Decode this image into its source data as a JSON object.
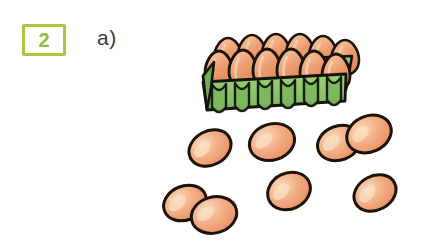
{
  "page": {
    "type": "math-worksheet-exercise",
    "background_color": "#ffffff",
    "width": 435,
    "height": 252
  },
  "exercise": {
    "number": "2",
    "badge_border_color": "#a9ca3c",
    "badge_text_color": "#93bd3e",
    "part_label": "a)",
    "part_label_color": "#3a3a3a"
  },
  "illustration": {
    "name": "eggs-and-carton",
    "description": "An open egg carton filled with eggs, plus loose eggs scattered below",
    "colors": {
      "egg_fill": "#eb9a6e",
      "egg_highlight": "#f6cdab",
      "egg_outline": "#1c1208",
      "carton_fill": "#8dc46b",
      "carton_shade": "#6fae54",
      "carton_outline": "#13140c"
    },
    "carton": {
      "name": "egg-carton",
      "egg_count": 12,
      "rows": [
        {
          "name": "carton-back-row",
          "count": 6
        },
        {
          "name": "carton-front-row",
          "count": 6
        }
      ]
    },
    "loose_eggs": {
      "name": "loose-eggs-group",
      "count": 8,
      "eggs": [
        {
          "name": "loose-egg-1",
          "cx": 210,
          "cy": 148,
          "rx": 22,
          "ry": 17,
          "rot": -28
        },
        {
          "name": "loose-egg-2",
          "cx": 272,
          "cy": 142,
          "rx": 23,
          "ry": 18,
          "rot": -18
        },
        {
          "name": "loose-egg-3",
          "cx": 339,
          "cy": 143,
          "rx": 22,
          "ry": 17,
          "rot": -20
        },
        {
          "name": "loose-egg-4",
          "cx": 369,
          "cy": 134,
          "rx": 23,
          "ry": 18,
          "rot": -24
        },
        {
          "name": "loose-egg-5",
          "cx": 185,
          "cy": 203,
          "rx": 22,
          "ry": 17,
          "rot": -22
        },
        {
          "name": "loose-egg-6",
          "cx": 214,
          "cy": 215,
          "rx": 23,
          "ry": 18,
          "rot": -15
        },
        {
          "name": "loose-egg-7",
          "cx": 289,
          "cy": 191,
          "rx": 22,
          "ry": 18,
          "rot": -25
        },
        {
          "name": "loose-egg-8",
          "cx": 375,
          "cy": 193,
          "rx": 22,
          "ry": 17,
          "rot": -28
        }
      ]
    },
    "totals": {
      "eggs_in_carton": 12,
      "loose_eggs": 8,
      "total_eggs": 20
    }
  }
}
